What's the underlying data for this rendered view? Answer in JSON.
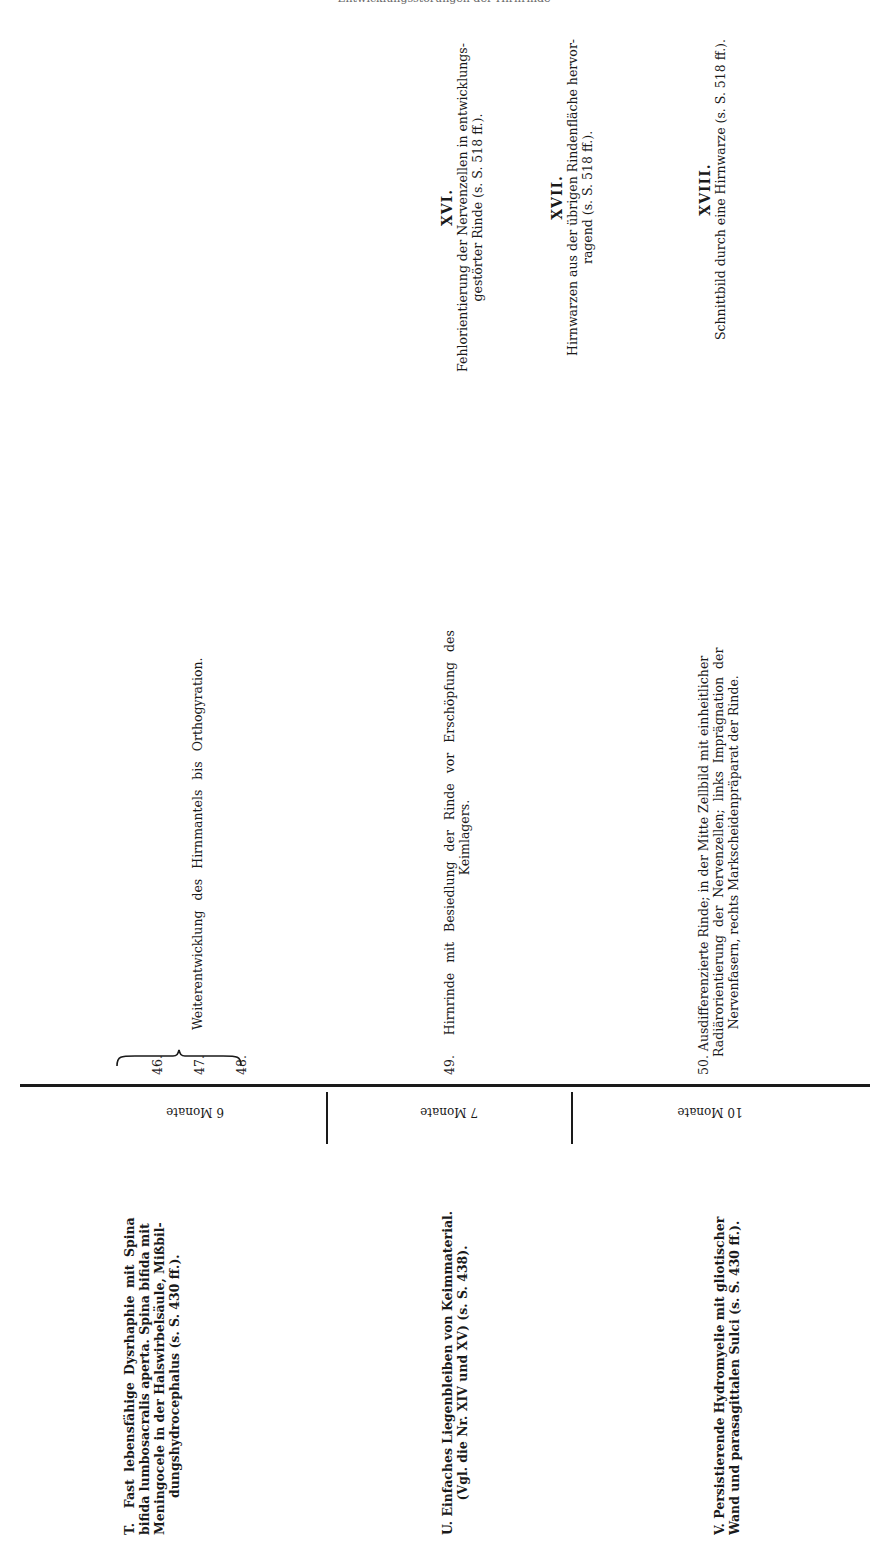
{
  "page": {
    "header_cut_text": "Entwicklungsstörungen der Hirnrinde"
  },
  "upper": {
    "entries": [
      {
        "num": "46."
      },
      {
        "num": "47.",
        "text": "Weiterentwicklung des Hirnmantels bis Orthogyration."
      },
      {
        "num": "48."
      },
      {
        "num": "49.",
        "text_line1": "Hirnrinde mit Besiedlung der Rinde vor Erschöpfung des",
        "text_line2": "Keimlagers."
      },
      {
        "num": "50.",
        "text_line1": "Ausdifferenzierte Rinde; in der Mitte Zellbild mit einheitlicher",
        "text_line2": "Radiärorientierung der Nervenzellen; links Imprägnation der",
        "text_line3": "Nervenfasern, rechts Markscheidenpräparat der Rinde."
      }
    ],
    "plates": [
      {
        "numeral": "XVI.",
        "line1": "Fehlorientierung der Nervenzellen in entwicklungs-",
        "line2": "gestörter Rinde (s. S. 518 ff.)."
      },
      {
        "numeral": "XVII.",
        "line1": "Hirnwarzen aus der übrigen Rindenfläche hervor-",
        "line2": "ragend (s. S. 518 ff.)."
      },
      {
        "numeral": "XVIII.",
        "line1": "Schnittbild durch eine Hirnwarze (s. S. 518 ff.)."
      }
    ]
  },
  "lower": {
    "ages": [
      "6 Monate",
      "7 Monate",
      "10 Monate"
    ],
    "cases": [
      {
        "letter": "T.",
        "line1": "Fast lebensfähige Dysrhaphie mit Spina",
        "line2": "bifida lumbosacralis aperta. Spina bifida mit",
        "line3": "Meningocele in der Halswirbelsäule, Mißbil-",
        "line4": "dungshydrocephalus (s. S. 430 ff.)."
      },
      {
        "letter": "U.",
        "line1": "Einfaches Liegenbleiben von Keimmaterial.",
        "line2": "(Vgl. die Nr. XIV und XV) (s. S. 438)."
      },
      {
        "letter": "V.",
        "line1": "Persistierende Hydromyelie mit gliotischer",
        "line2": "Wand und parasagittalen Sulci (s. S. 430 ff.)."
      }
    ]
  }
}
